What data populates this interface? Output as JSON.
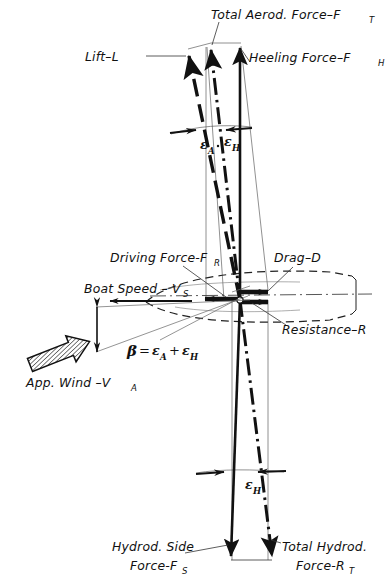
{
  "diagram": {
    "type": "vector-force-diagram",
    "background_color": "#ffffff",
    "ink_color": "#111111"
  },
  "labels": {
    "total_aero_force": {
      "text": "Total Aerod. Force–F",
      "sub": "T"
    },
    "lift": {
      "text": "Lift–L",
      "sub": ""
    },
    "heeling_force": {
      "text": "Heeling Force–F",
      "sub": "H"
    },
    "driving_force": {
      "text": "Driving Force-F",
      "sub": "R"
    },
    "drag": {
      "text": "Drag–D",
      "sub": ""
    },
    "boat_speed": {
      "text": "Boat Speed – V",
      "sub": "S"
    },
    "resistance": {
      "text": "Resistance–R",
      "sub": ""
    },
    "app_wind": {
      "text": "App. Wind –V",
      "sub": "A"
    },
    "hydro_side_force_line1": "Hydrod. Side",
    "hydro_side_force_line2": {
      "text": "Force-F",
      "sub": "S"
    },
    "total_hydro_force_line1": "Total  Hydrod.",
    "total_hydro_force_line2": {
      "text": "Force-R",
      "sub": "T"
    }
  },
  "angles": {
    "epsilon_a_top": {
      "symbol": "ε",
      "sub": "A"
    },
    "epsilon_h_top": {
      "symbol": "ε",
      "sub": "H"
    },
    "epsilon_h_bottom": {
      "symbol": "ε",
      "sub": "H"
    },
    "beta_equation": {
      "symbol": "β",
      "equals": "=",
      "term_a": "ε",
      "term_a_sub": "A",
      "plus": "+",
      "term_b": "ε",
      "term_b_sub": "H"
    }
  },
  "vectors": [
    {
      "name": "lift-L",
      "style": "dashed",
      "direction": "up-left-tilted"
    },
    {
      "name": "total-aerodynamic-force-FT",
      "style": "dash-dot",
      "direction": "up-tilted"
    },
    {
      "name": "heeling-force-FH",
      "style": "solid",
      "direction": "up-vertical"
    },
    {
      "name": "driving-force-FR",
      "style": "solid-thick",
      "direction": "left"
    },
    {
      "name": "drag-D",
      "style": "solid-thick",
      "direction": "right"
    },
    {
      "name": "resistance-R",
      "style": "solid-thick",
      "direction": "right"
    },
    {
      "name": "boat-speed-VS",
      "style": "solid",
      "direction": "left"
    },
    {
      "name": "apparent-wind-VA",
      "style": "hatched-block-arrow",
      "direction": "up-right"
    },
    {
      "name": "hydrodynamic-side-force-FS",
      "style": "solid",
      "direction": "down-vertical"
    },
    {
      "name": "total-hydrodynamic-force-RT",
      "style": "dash-dot",
      "direction": "down-tilted"
    }
  ]
}
